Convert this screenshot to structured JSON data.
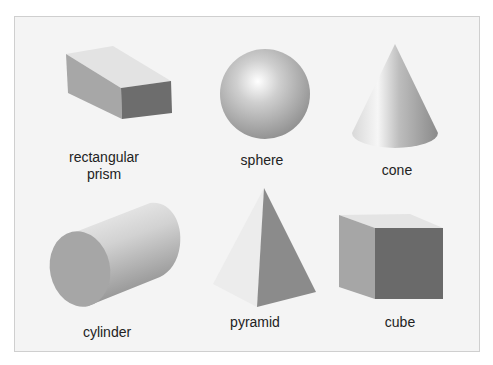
{
  "figure": {
    "shapes": [
      {
        "name": "rectangular prism",
        "label": "rectangular\nprism"
      },
      {
        "name": "sphere",
        "label": "sphere"
      },
      {
        "name": "cone",
        "label": "cone"
      },
      {
        "name": "cylinder",
        "label": "cylinder"
      },
      {
        "name": "pyramid",
        "label": "pyramid"
      },
      {
        "name": "cube",
        "label": "cube"
      }
    ]
  },
  "colors": {
    "background": "#f4f4f4",
    "border": "#cfcfcf",
    "light_face": "#e4e4e4",
    "mid_face": "#a8a8a8",
    "dark_face": "#6b6b6b",
    "label_text": "#222222"
  }
}
